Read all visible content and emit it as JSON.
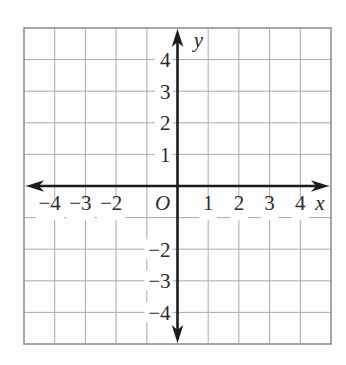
{
  "figure": {
    "name": "blank-coordinate-plane",
    "origin_label": "O",
    "x_axis": {
      "label": "x",
      "ticks": [
        {
          "value": -4,
          "label": "−4"
        },
        {
          "value": -3,
          "label": "−3"
        },
        {
          "value": -2,
          "label": "−2"
        },
        {
          "value": 1,
          "label": "1"
        },
        {
          "value": 2,
          "label": "2"
        },
        {
          "value": 3,
          "label": "3"
        },
        {
          "value": 4,
          "label": "4"
        }
      ]
    },
    "y_axis": {
      "label": "y",
      "ticks": [
        {
          "value": 4,
          "label": "4"
        },
        {
          "value": 3,
          "label": "3"
        },
        {
          "value": 2,
          "label": "2"
        },
        {
          "value": 1,
          "label": "1"
        },
        {
          "value": -2,
          "label": "−2"
        },
        {
          "value": -3,
          "label": "−3"
        },
        {
          "value": -4,
          "label": "−4"
        }
      ]
    },
    "colors": {
      "background": "#fdfdfd",
      "grid_line": "#a8abad",
      "grid_border": "#95989b",
      "axis": "#1c1c1c",
      "label_text": "#2b2b2b"
    }
  },
  "chart_data": {
    "type": "scatter",
    "series": [],
    "title": "",
    "xlabel": "x",
    "ylabel": "y",
    "xlim": [
      -5,
      5
    ],
    "ylim": [
      -5,
      5
    ],
    "grid": true,
    "legend": false,
    "x_tick_labels": [
      "−4",
      "−3",
      "−2",
      "1",
      "2",
      "3",
      "4"
    ],
    "y_tick_labels": [
      "4",
      "3",
      "2",
      "1",
      "−2",
      "−3",
      "−4"
    ],
    "origin_label": "O",
    "annotations": []
  }
}
